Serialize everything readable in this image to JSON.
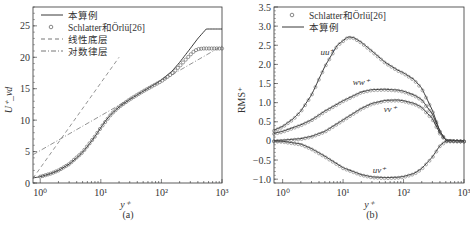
{
  "chart_data": [
    {
      "id": "a",
      "type": "line",
      "caption": "(a)",
      "title": "",
      "xlabel": "y⁺",
      "ylabel": "U⁺_vd",
      "xscale": "log",
      "xlim": [
        0.76,
        1000
      ],
      "ylim": [
        0,
        28
      ],
      "xticks": [
        "10⁰",
        "10¹",
        "10²",
        "10³"
      ],
      "yticks": [
        "0",
        "5",
        "10",
        "15",
        "20",
        "25"
      ],
      "grid": false,
      "legend_position": "upper left",
      "legend": [
        "本算例",
        "Schlatter和Örlü[26]",
        "线性底层",
        "对数律层"
      ],
      "series": [
        {
          "name": "本算例",
          "style": "solid",
          "x": [
            0.76,
            1,
            1.5,
            2,
            3,
            4,
            5,
            6,
            8,
            10,
            12,
            15,
            20,
            30,
            50,
            80,
            100,
            150,
            200,
            300,
            400,
            550,
            1000
          ],
          "y": [
            0.8,
            1.0,
            1.5,
            2.0,
            3.0,
            4.0,
            4.9,
            5.8,
            7.4,
            8.8,
            9.9,
            11.0,
            12.1,
            13.3,
            14.6,
            15.8,
            16.4,
            17.8,
            19.2,
            21.4,
            23.0,
            24.5,
            24.5
          ]
        },
        {
          "name": "Schlatter和Örlü[26]",
          "style": "circles",
          "x": [
            1,
            1.5,
            2,
            3,
            5,
            8,
            10,
            15,
            20,
            30,
            50,
            100,
            150,
            200,
            250,
            300,
            350,
            400,
            500,
            700,
            1000
          ],
          "y": [
            1.0,
            1.5,
            2.0,
            3.0,
            4.9,
            7.4,
            8.8,
            11.0,
            12.1,
            13.3,
            14.6,
            16.2,
            17.4,
            18.6,
            19.6,
            20.4,
            21.0,
            21.3,
            21.4,
            21.4,
            21.4
          ]
        },
        {
          "name": "线性底层",
          "style": "dashed",
          "x": [
            0.76,
            20
          ],
          "y": [
            0.76,
            20
          ]
        },
        {
          "name": "对数律层",
          "style": "dashdot",
          "x": [
            0.76,
            1000
          ],
          "y": [
            4.5,
            21.8
          ]
        }
      ]
    },
    {
      "id": "b",
      "type": "line",
      "caption": "(b)",
      "title": "",
      "xlabel": "y⁺",
      "ylabel": "RMS⁺",
      "xscale": "log",
      "xlim": [
        0.72,
        1000
      ],
      "ylim": [
        -1.1,
        3.5
      ],
      "xticks": [
        "10⁰",
        "10¹",
        "10²",
        "10³"
      ],
      "yticks": [
        "-1.0",
        "-0.5",
        "0",
        "0.5",
        "1.0",
        "1.5",
        "2.0",
        "2.5",
        "3.0",
        "3.5"
      ],
      "grid": false,
      "legend_position": "upper left",
      "legend": [
        "Schlatter和Örlü[26]",
        "本算例"
      ],
      "annotations": [
        {
          "text": "uu⁺_rms",
          "x": 5.5,
          "y": 2.25
        },
        {
          "text": "ww⁺_rms",
          "x": 20,
          "y": 1.45
        },
        {
          "text": "vv⁺_rms",
          "x": 60,
          "y": 0.75
        },
        {
          "text": "uv⁺",
          "x": 40,
          "y": -0.85
        }
      ],
      "series": [
        {
          "name": "uu⁺_rms (本算例)",
          "style": "solid",
          "x": [
            0.72,
            1,
            1.5,
            2,
            3,
            5,
            8,
            12,
            15,
            20,
            30,
            50,
            80,
            100,
            150,
            200,
            300,
            400,
            500,
            1000
          ],
          "y": [
            0.28,
            0.38,
            0.58,
            0.78,
            1.2,
            1.95,
            2.5,
            2.72,
            2.7,
            2.58,
            2.35,
            2.05,
            1.85,
            1.78,
            1.6,
            1.38,
            0.8,
            0.25,
            0.02,
            0.0
          ]
        },
        {
          "name": "ww⁺_rms (本算例)",
          "style": "solid",
          "x": [
            0.72,
            1,
            2,
            3,
            5,
            10,
            20,
            30,
            50,
            80,
            100,
            150,
            200,
            300,
            400,
            500,
            1000
          ],
          "y": [
            0.2,
            0.25,
            0.42,
            0.55,
            0.78,
            1.05,
            1.28,
            1.34,
            1.35,
            1.33,
            1.3,
            1.2,
            1.08,
            0.7,
            0.25,
            0.02,
            0.0
          ]
        },
        {
          "name": "vv⁺_rms (本算例)",
          "style": "solid",
          "x": [
            0.72,
            1,
            2,
            3,
            5,
            10,
            20,
            30,
            50,
            80,
            100,
            150,
            200,
            300,
            400,
            500,
            1000
          ],
          "y": [
            0.01,
            0.02,
            0.06,
            0.12,
            0.25,
            0.55,
            0.85,
            0.98,
            1.06,
            1.07,
            1.05,
            0.98,
            0.88,
            0.58,
            0.2,
            0.02,
            0.0
          ]
        },
        {
          "name": "uv⁺ (本算例)",
          "style": "solid",
          "x": [
            0.72,
            1,
            2,
            3,
            5,
            10,
            20,
            30,
            50,
            80,
            100,
            150,
            200,
            300,
            400,
            500,
            1000
          ],
          "y": [
            0.0,
            -0.01,
            -0.08,
            -0.2,
            -0.4,
            -0.7,
            -0.88,
            -0.94,
            -0.96,
            -0.95,
            -0.93,
            -0.85,
            -0.72,
            -0.42,
            -0.12,
            0.0,
            0.0
          ]
        }
      ]
    }
  ]
}
